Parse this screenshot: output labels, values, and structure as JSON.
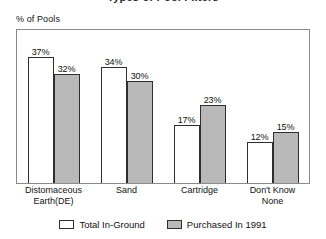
{
  "title_clipped": "Types of Pool Filters",
  "y_axis_caption": "% of Pools",
  "legend": {
    "items": [
      {
        "label": "Total In-Ground",
        "swatch": "white-swatch"
      },
      {
        "label": "Purchased In 1991",
        "swatch": "gray-swatch"
      }
    ]
  },
  "colors": {
    "series_total_in_ground": "#ffffff",
    "series_purchased_1991": "#b9b9b9",
    "bar_outline": "#2e2e2e",
    "frame": "#8a8a8a",
    "text": "#111111",
    "background": "#ffffff"
  },
  "chart_data": {
    "type": "bar",
    "title": "Types of Pool Filters",
    "xlabel": "",
    "ylabel": "% of Pools",
    "ylim": [
      0,
      45
    ],
    "grid": false,
    "legend_position": "bottom-center",
    "axis_ticks_visible": false,
    "categories": [
      "Distomaceous Earth(DE)",
      "Sand",
      "Cartridge",
      "Don't Know None"
    ],
    "category_lines": [
      [
        "Distomaceous",
        "Earth(DE)"
      ],
      [
        "Sand"
      ],
      [
        "Cartridge"
      ],
      [
        "Don't Know",
        "None"
      ]
    ],
    "series": [
      {
        "name": "Total In-Ground",
        "values": [
          37,
          34,
          17,
          12
        ],
        "labels": [
          "37%",
          "34%",
          "17%",
          "12%"
        ]
      },
      {
        "name": "Purchased In 1991",
        "values": [
          32,
          30,
          23,
          15
        ],
        "labels": [
          "32%",
          "30%",
          "23%",
          "15%"
        ]
      }
    ]
  }
}
